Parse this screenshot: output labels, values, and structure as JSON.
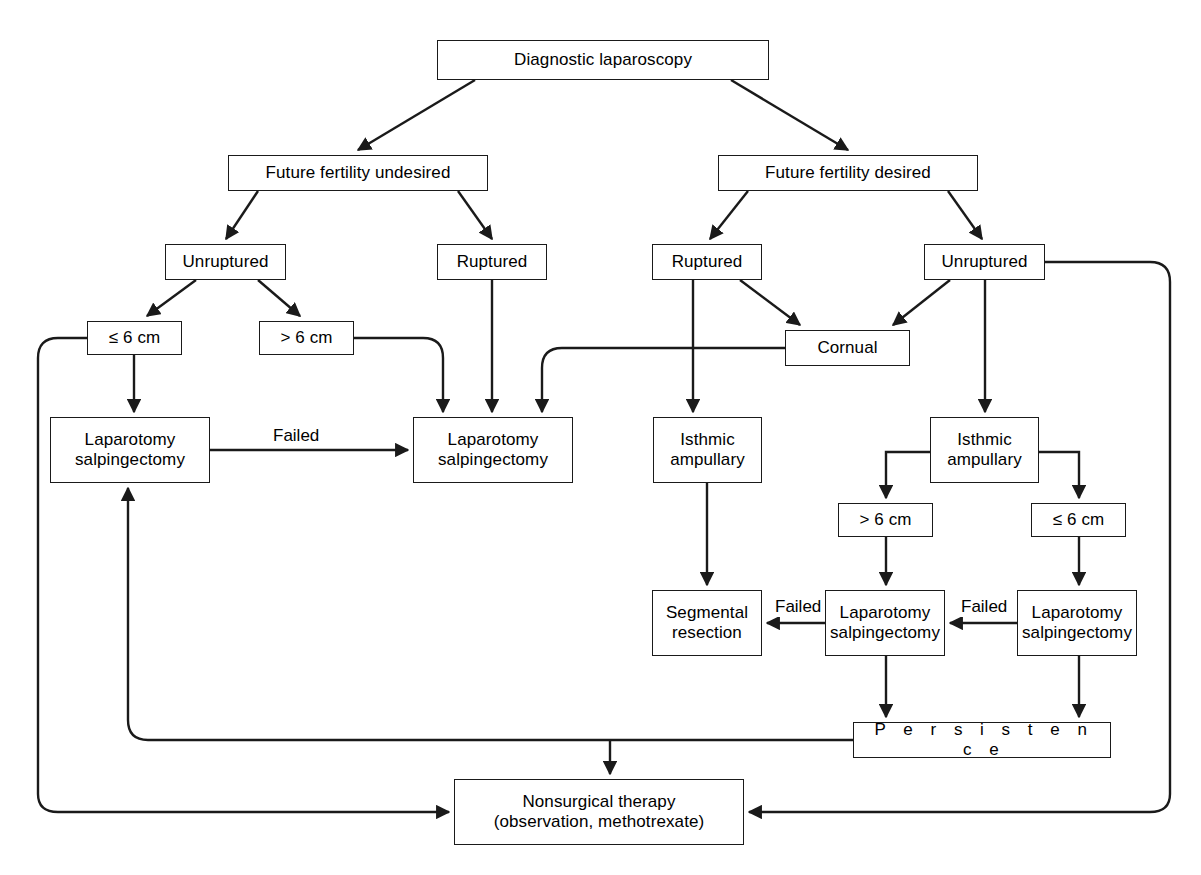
{
  "diagram": {
    "type": "flowchart",
    "background_color": "#ffffff",
    "line_color": "#1a1a1a",
    "text_color": "#000000",
    "nodes": [
      {
        "id": "diagnostic_laparoscopy",
        "label": "Diagnostic laparoscopy",
        "x": 437,
        "y": 40,
        "w": 332,
        "h": 40
      },
      {
        "id": "fertility_undesired",
        "label": "Future fertility undesired",
        "x": 228,
        "y": 155,
        "w": 260,
        "h": 36
      },
      {
        "id": "fertility_desired",
        "label": "Future fertility desired",
        "x": 718,
        "y": 155,
        "w": 260,
        "h": 36
      },
      {
        "id": "unruptured_left",
        "label": "Unruptured",
        "x": 165,
        "y": 244,
        "w": 121,
        "h": 36
      },
      {
        "id": "ruptured_left",
        "label": "Ruptured",
        "x": 437,
        "y": 244,
        "w": 110,
        "h": 36
      },
      {
        "id": "ruptured_right",
        "label": "Ruptured",
        "x": 652,
        "y": 244,
        "w": 110,
        "h": 36
      },
      {
        "id": "unruptured_right",
        "label": "Unruptured",
        "x": 924,
        "y": 244,
        "w": 121,
        "h": 36
      },
      {
        "id": "size_le6_left",
        "label": "≤ 6 cm",
        "x": 87,
        "y": 321,
        "w": 95,
        "h": 34
      },
      {
        "id": "size_gt6_left",
        "label": "> 6 cm",
        "x": 259,
        "y": 321,
        "w": 95,
        "h": 34
      },
      {
        "id": "cornual",
        "label": "Cornual",
        "x": 785,
        "y": 330,
        "w": 125,
        "h": 36
      },
      {
        "id": "laparotomy_left",
        "label": "Laparotomy\nsalpingectomy",
        "x": 50,
        "y": 417,
        "w": 160,
        "h": 66
      },
      {
        "id": "laparotomy_mid",
        "label": "Laparotomy\nsalpingectomy",
        "x": 413,
        "y": 417,
        "w": 160,
        "h": 66
      },
      {
        "id": "isthmic_left",
        "label": "Isthmic\nampullary",
        "x": 653,
        "y": 417,
        "w": 109,
        "h": 66
      },
      {
        "id": "isthmic_right",
        "label": "Isthmic\nampullary",
        "x": 930,
        "y": 417,
        "w": 109,
        "h": 66
      },
      {
        "id": "size_gt6_right",
        "label": "> 6 cm",
        "x": 838,
        "y": 503,
        "w": 95,
        "h": 34
      },
      {
        "id": "size_le6_right",
        "label": "≤ 6 cm",
        "x": 1031,
        "y": 503,
        "w": 95,
        "h": 34
      },
      {
        "id": "segmental_resection",
        "label": "Segmental\nresection",
        "x": 652,
        "y": 590,
        "w": 110,
        "h": 66
      },
      {
        "id": "laparotomy_mid_right",
        "label": "Laparotomy\nsalpingectomy",
        "x": 825,
        "y": 590,
        "w": 120,
        "h": 66
      },
      {
        "id": "laparotomy_far_right",
        "label": "Laparotomy\nsalpingectomy",
        "x": 1017,
        "y": 590,
        "w": 120,
        "h": 66
      },
      {
        "id": "persistence",
        "label": "P e r s i s t e n c e",
        "x": 853,
        "y": 722,
        "w": 258,
        "h": 36,
        "spaced": true
      },
      {
        "id": "nonsurgical_therapy",
        "label": "Nonsurgical therapy\n(observation, methotrexate)",
        "x": 454,
        "y": 779,
        "w": 290,
        "h": 66
      }
    ],
    "edge_labels": [
      {
        "id": "failed_left",
        "text": "Failed",
        "x": 270,
        "y": 426
      },
      {
        "id": "failed_mid",
        "text": "Failed",
        "x": 772,
        "y": 597
      },
      {
        "id": "failed_right",
        "text": "Failed",
        "x": 958,
        "y": 597
      }
    ],
    "edges": [
      {
        "from": "diagnostic_laparoscopy",
        "to": "fertility_undesired",
        "label": ""
      },
      {
        "from": "diagnostic_laparoscopy",
        "to": "fertility_desired",
        "label": ""
      },
      {
        "from": "fertility_undesired",
        "to": "unruptured_left",
        "label": ""
      },
      {
        "from": "fertility_undesired",
        "to": "ruptured_left",
        "label": ""
      },
      {
        "from": "fertility_desired",
        "to": "ruptured_right",
        "label": ""
      },
      {
        "from": "fertility_desired",
        "to": "unruptured_right",
        "label": ""
      },
      {
        "from": "unruptured_left",
        "to": "size_le6_left",
        "label": ""
      },
      {
        "from": "unruptured_left",
        "to": "size_gt6_left",
        "label": ""
      },
      {
        "from": "size_le6_left",
        "to": "laparotomy_left",
        "label": ""
      },
      {
        "from": "size_gt6_left",
        "to": "laparotomy_mid",
        "label": ""
      },
      {
        "from": "ruptured_left",
        "to": "laparotomy_mid",
        "label": ""
      },
      {
        "from": "ruptured_right",
        "to": "isthmic_left",
        "label": ""
      },
      {
        "from": "ruptured_right",
        "to": "cornual",
        "label": ""
      },
      {
        "from": "unruptured_right",
        "to": "cornual",
        "label": ""
      },
      {
        "from": "unruptured_right",
        "to": "isthmic_right",
        "label": ""
      },
      {
        "from": "cornual",
        "to": "laparotomy_mid",
        "label": ""
      },
      {
        "from": "laparotomy_left",
        "to": "laparotomy_mid",
        "label": "Failed"
      },
      {
        "from": "isthmic_left",
        "to": "segmental_resection",
        "label": ""
      },
      {
        "from": "isthmic_right",
        "to": "size_gt6_right",
        "label": ""
      },
      {
        "from": "isthmic_right",
        "to": "size_le6_right",
        "label": ""
      },
      {
        "from": "size_gt6_right",
        "to": "laparotomy_mid_right",
        "label": ""
      },
      {
        "from": "size_le6_right",
        "to": "laparotomy_far_right",
        "label": ""
      },
      {
        "from": "laparotomy_mid_right",
        "to": "segmental_resection",
        "label": "Failed"
      },
      {
        "from": "laparotomy_far_right",
        "to": "laparotomy_mid_right",
        "label": "Failed"
      },
      {
        "from": "laparotomy_mid_right",
        "to": "persistence",
        "label": ""
      },
      {
        "from": "laparotomy_far_right",
        "to": "persistence",
        "label": ""
      },
      {
        "from": "persistence",
        "to": "laparotomy_left",
        "label": ""
      },
      {
        "from": "persistence",
        "to": "nonsurgical_therapy",
        "label": ""
      },
      {
        "from": "size_le6_left",
        "to": "nonsurgical_therapy",
        "label": ""
      },
      {
        "from": "unruptured_right",
        "to": "nonsurgical_therapy",
        "label": ""
      }
    ]
  }
}
